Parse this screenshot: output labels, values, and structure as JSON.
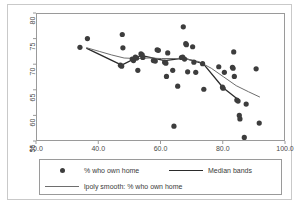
{
  "chart_data": {
    "type": "scatter",
    "title": "",
    "xlabel": "",
    "ylabel": "",
    "xlim": [
      20.0,
      100.0
    ],
    "ylim": [
      55,
      80
    ],
    "xticks": [
      "20.0",
      "40.0",
      "60.0",
      "80.0",
      "100.0"
    ],
    "xtick_values": [
      20.0,
      40.0,
      60.0,
      80.0,
      100.0
    ],
    "yticks": [
      "55",
      "60",
      "65",
      "70",
      "75",
      "80"
    ],
    "ytick_values": [
      55,
      60,
      65,
      70,
      75,
      80
    ],
    "grid": false,
    "legend_position": "bottom",
    "series": [
      {
        "name": "% who own home",
        "type": "scatter",
        "marker": "filled-circle",
        "color": "#3d3d3d",
        "points": [
          [
            33.8,
            73.5
          ],
          [
            36.2,
            75.2
          ],
          [
            46.8,
            70.0
          ],
          [
            47.2,
            69.8
          ],
          [
            47.4,
            76.0
          ],
          [
            47.6,
            73.4
          ],
          [
            50.6,
            71.2
          ],
          [
            51.0,
            70.9
          ],
          [
            51.6,
            71.6
          ],
          [
            52.0,
            71.4
          ],
          [
            52.4,
            69.0
          ],
          [
            53.4,
            72.2
          ],
          [
            53.8,
            72.0
          ],
          [
            54.0,
            71.5
          ],
          [
            57.4,
            70.9
          ],
          [
            58.0,
            70.8
          ],
          [
            58.6,
            73.0
          ],
          [
            59.0,
            72.9
          ],
          [
            61.0,
            70.6
          ],
          [
            61.4,
            70.4
          ],
          [
            61.6,
            67.8
          ],
          [
            62.0,
            72.4
          ],
          [
            63.6,
            69.0
          ],
          [
            64.0,
            58.1
          ],
          [
            65.2,
            65.9
          ],
          [
            66.4,
            71.5
          ],
          [
            66.8,
            71.6
          ],
          [
            67.0,
            77.5
          ],
          [
            67.4,
            71.2
          ],
          [
            67.8,
            74.2
          ],
          [
            68.0,
            74.0
          ],
          [
            68.4,
            68.7
          ],
          [
            70.0,
            73.6
          ],
          [
            70.4,
            70.6
          ],
          [
            71.0,
            68.6
          ],
          [
            73.2,
            70.3
          ],
          [
            73.6,
            65.3
          ],
          [
            78.4,
            69.7
          ],
          [
            79.6,
            65.7
          ],
          [
            79.8,
            65.5
          ],
          [
            80.2,
            68.6
          ],
          [
            82.8,
            69.6
          ],
          [
            83.0,
            69.4
          ],
          [
            83.2,
            72.6
          ],
          [
            83.4,
            67.8
          ],
          [
            84.2,
            63.2
          ],
          [
            84.6,
            63.0
          ],
          [
            85.0,
            60.2
          ],
          [
            85.2,
            59.5
          ],
          [
            86.6,
            55.9
          ],
          [
            87.2,
            62.4
          ],
          [
            90.4,
            69.3
          ],
          [
            91.4,
            58.7
          ]
        ]
      },
      {
        "name": "Median bands",
        "type": "line",
        "color": "#2b2b2b",
        "linewidth": 1.3,
        "points": [
          [
            36.0,
            73.3
          ],
          [
            47.2,
            70.0
          ],
          [
            53.4,
            71.9
          ],
          [
            61.0,
            70.9
          ],
          [
            67.2,
            71.4
          ],
          [
            73.4,
            70.3
          ],
          [
            79.8,
            65.6
          ],
          [
            85.0,
            63.1
          ]
        ]
      },
      {
        "name": "lpoly smooth: % who own home",
        "type": "line",
        "color": "#6e6e6e",
        "linewidth": 1.0,
        "points": [
          [
            36.0,
            73.4
          ],
          [
            40.0,
            72.7
          ],
          [
            44.0,
            72.0
          ],
          [
            48.0,
            71.4
          ],
          [
            52.0,
            71.3
          ],
          [
            56.0,
            71.4
          ],
          [
            60.0,
            71.3
          ],
          [
            64.0,
            71.3
          ],
          [
            68.0,
            71.2
          ],
          [
            72.0,
            70.7
          ],
          [
            76.0,
            69.4
          ],
          [
            80.0,
            67.7
          ],
          [
            84.0,
            66.0
          ],
          [
            88.0,
            64.8
          ],
          [
            91.5,
            63.8
          ]
        ]
      }
    ]
  },
  "legend": {
    "entries": [
      {
        "label": "% who own home",
        "key": "marker-dot"
      },
      {
        "label": "Median bands",
        "key": "line-thick"
      },
      {
        "label": "lpoly smooth: % who own home",
        "key": "line-thin"
      }
    ]
  }
}
